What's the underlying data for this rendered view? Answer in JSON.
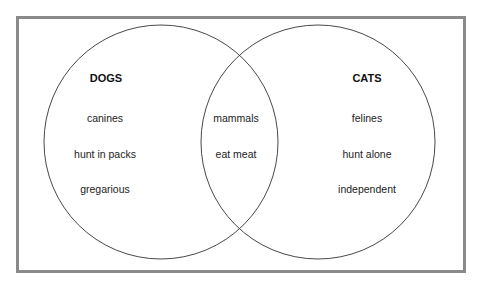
{
  "diagram": {
    "type": "venn",
    "left_set": {
      "title": "DOGS",
      "items": [
        "canines",
        "hunt in packs",
        "gregarious"
      ]
    },
    "right_set": {
      "title": "CATS",
      "items": [
        "felines",
        "hunt alone",
        "independent"
      ]
    },
    "intersection": {
      "items": [
        "mammals",
        "eat meat"
      ]
    },
    "colors": {
      "frame_border": "#8a8a8a",
      "circle_stroke": "#333333",
      "text": "#222222",
      "background": "#ffffff"
    }
  }
}
